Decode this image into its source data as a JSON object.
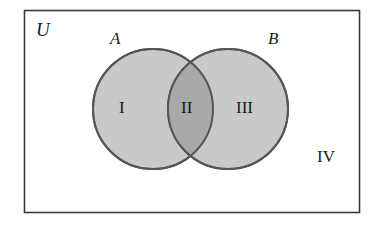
{
  "diagram": {
    "type": "venn-two-set",
    "background_color": "#ffffff",
    "universe": {
      "label": "U",
      "border_color": "#3a3a3a",
      "fill_color": "#ffffff",
      "x": 24,
      "y": 10,
      "width": 336,
      "height": 203
    },
    "sets": [
      {
        "id": "A",
        "label": "A",
        "center_x": 153,
        "center_y": 109,
        "radius": 60,
        "fill_color": "#c9c9c9",
        "stroke_color": "#555555"
      },
      {
        "id": "B",
        "label": "B",
        "center_x": 228,
        "center_y": 109,
        "radius": 60,
        "fill_color": "#c9c9c9",
        "stroke_color": "#555555"
      }
    ],
    "intersection": {
      "fill_color": "#a9a9a9",
      "stroke_color": "#555555"
    },
    "regions": [
      {
        "id": "region-i",
        "label": "I",
        "meaning": "A only",
        "center_x": 126,
        "center_y": 108
      },
      {
        "id": "region-ii",
        "label": "II",
        "meaning": "A and B",
        "center_x": 190,
        "center_y": 108
      },
      {
        "id": "region-iii",
        "label": "III",
        "meaning": "B only",
        "center_x": 248,
        "center_y": 108
      },
      {
        "id": "region-iv",
        "label": "IV",
        "meaning": "outside A and B",
        "center_x": 325,
        "center_y": 157
      }
    ]
  }
}
